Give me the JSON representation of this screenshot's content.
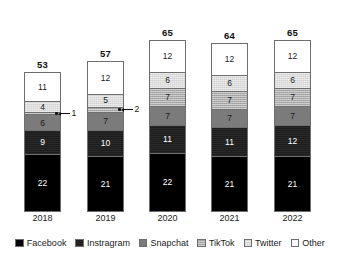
{
  "chart_data": {
    "type": "bar",
    "title": "",
    "subtitle": "",
    "xlabel": "",
    "ylabel": "",
    "stacked": true,
    "grid": false,
    "legend_position": "bottom",
    "ylim": [
      0,
      65
    ],
    "categories": [
      "2018",
      "2019",
      "2020",
      "2021",
      "2022"
    ],
    "series": [
      {
        "name": "Facebook",
        "color": "#000000",
        "values": [
          22,
          21,
          22,
          21,
          21
        ]
      },
      {
        "name": "Instragram",
        "color": "#1d1d1d",
        "values": [
          9,
          10,
          11,
          11,
          12
        ]
      },
      {
        "name": "Snapchat",
        "color": "#7b7b7b",
        "values": [
          6,
          7,
          7,
          7,
          7
        ]
      },
      {
        "name": "TikTok",
        "color": "#a9a9a9",
        "values": [
          1,
          2,
          7,
          7,
          7
        ]
      },
      {
        "name": "Twitter",
        "color": "#dcdcdc",
        "values": [
          4,
          5,
          6,
          6,
          6
        ]
      },
      {
        "name": "Other",
        "color": "#ffffff",
        "values": [
          11,
          12,
          12,
          12,
          12
        ]
      }
    ],
    "totals": [
      53,
      57,
      65,
      64,
      65
    ],
    "annotations": [
      {
        "category": "2018",
        "series": "TikTok",
        "label": "1",
        "style": "leader-line"
      },
      {
        "category": "2019",
        "series": "TikTok",
        "label": "2",
        "style": "leader-line"
      }
    ]
  },
  "legend": {
    "items": [
      {
        "label": "Facebook",
        "swatch": "facebook-swatch"
      },
      {
        "label": "Instragram",
        "swatch": "instagram-swatch"
      },
      {
        "label": "Snapchat",
        "swatch": "snapchat-swatch"
      },
      {
        "label": "TikTok",
        "swatch": "tiktok-swatch"
      },
      {
        "label": "Twitter",
        "swatter": "twitter-swatch",
        "swatch": "twitter-swatch"
      },
      {
        "label": "Other",
        "swatch": "other-swatch"
      }
    ]
  }
}
